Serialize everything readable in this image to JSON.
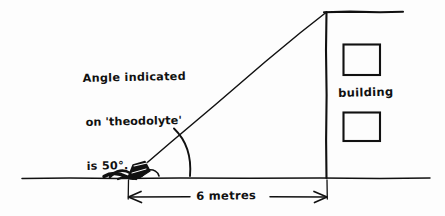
{
  "figure": {
    "kind": "hand-drawn-sketch",
    "background_color": "#fdfdfd",
    "ink_color": "#111111",
    "title_visible": false
  },
  "annotations": {
    "note": {
      "line1": "Angle indicated",
      "line2": "on 'theodolyte'",
      "line3": "is 50°."
    },
    "building_label": "building",
    "dimension_label": "6 metres"
  },
  "geometry": {
    "ground_line": {
      "x1": 22,
      "y1": 178,
      "x2": 430,
      "y2": 178
    },
    "building_wall": {
      "x1": 326,
      "y1": 12,
      "x2": 326,
      "y2": 178
    },
    "roof_line": {
      "x1": 326,
      "y1": 12,
      "x2": 403,
      "y2": 12
    },
    "sight_line": {
      "x1": 132,
      "y1": 176,
      "x2": 326,
      "y2": 13
    },
    "angle_arc": {
      "cx": 132,
      "cy": 176,
      "radius": 58,
      "start_deg": 0,
      "end_deg": 40
    },
    "theodolite_blob": {
      "x": 104,
      "y": 160,
      "width": 48,
      "height": 20
    },
    "windows": [
      {
        "x": 343,
        "y": 44,
        "width": 37,
        "height": 31
      },
      {
        "x": 343,
        "y": 112,
        "width": 37,
        "height": 29
      }
    ],
    "dimension_line": {
      "x1": 128,
      "y1": 197,
      "x2": 327,
      "y2": 197
    },
    "dimension_tick_left": {
      "x": 128,
      "y1": 178,
      "y2": 197
    },
    "dimension_tick_right": {
      "x": 327,
      "y1": 178,
      "y2": 197
    }
  },
  "measurements": {
    "angle_degrees": 50,
    "angle_unit": "°",
    "distance_value": 6,
    "distance_unit": "metres"
  }
}
